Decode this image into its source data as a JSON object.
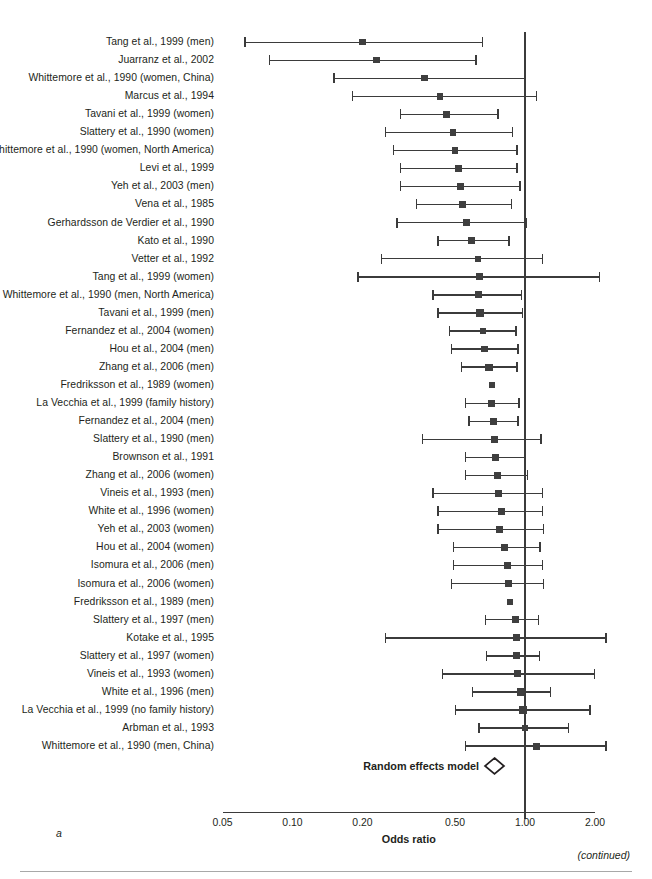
{
  "figure": {
    "panel_letter": "a",
    "continued_note": "(continued)",
    "axis_title": "Odds ratio",
    "summary_label": "Random effects model",
    "summary_marker": "diamond"
  },
  "chart_data": {
    "type": "forest",
    "title": "",
    "xlabel": "Odds ratio",
    "ylabel": "",
    "xscale": "log",
    "xlim": [
      0.05,
      2.0
    ],
    "xticks": [
      0.05,
      0.1,
      0.2,
      0.5,
      1.0,
      2.0
    ],
    "xticklabels": [
      "0.05",
      "0.10",
      "0.20",
      "0.50",
      "1.00",
      "2.00"
    ],
    "reference_line": 1.0,
    "grid": false,
    "legend": "none",
    "effect_measure": "Odds ratio",
    "studies": [
      {
        "label": "Tang et al., 1999 (men)",
        "or": 0.2,
        "lcl": 0.062,
        "ucl": 0.66,
        "weight": 2.4
      },
      {
        "label": "Juarranz et al., 2002",
        "or": 0.23,
        "lcl": 0.079,
        "ucl": 0.62,
        "weight": 2.6
      },
      {
        "label": "Whittemore et al., 1990 (women, China)",
        "or": 0.37,
        "lcl": 0.15,
        "ucl": 1.0,
        "weight": 2.5
      },
      {
        "label": "Marcus et al., 1994",
        "or": 0.43,
        "lcl": 0.18,
        "ucl": 1.13,
        "weight": 2.7
      },
      {
        "label": "Tavani et al., 1999 (women)",
        "or": 0.46,
        "lcl": 0.29,
        "ucl": 0.77,
        "weight": 2.6
      },
      {
        "label": "Slattery et al., 1990 (women)",
        "or": 0.49,
        "lcl": 0.25,
        "ucl": 0.89,
        "weight": 2.9
      },
      {
        "label": "Whittemore et al., 1990 (women, North America)",
        "or": 0.5,
        "lcl": 0.27,
        "ucl": 0.93,
        "weight": 3.0
      },
      {
        "label": "Levi et al., 1999",
        "or": 0.52,
        "lcl": 0.29,
        "ucl": 0.93,
        "weight": 3.2
      },
      {
        "label": "Yeh et al., 2003 (men)",
        "or": 0.53,
        "lcl": 0.29,
        "ucl": 0.96,
        "weight": 3.3
      },
      {
        "label": "Vena et al., 1985",
        "or": 0.54,
        "lcl": 0.34,
        "ucl": 0.88,
        "weight": 3.4
      },
      {
        "label": "Gerhardsson de Verdier et al., 1990",
        "or": 0.56,
        "lcl": 0.28,
        "ucl": 1.02,
        "weight": 3.6
      },
      {
        "label": "Kato et al., 1990",
        "or": 0.59,
        "lcl": 0.42,
        "ucl": 0.86,
        "weight": 3.1
      },
      {
        "label": "Vetter et al., 1992",
        "or": 0.63,
        "lcl": 0.24,
        "ucl": 1.2,
        "weight": 2.3
      },
      {
        "label": "Tang et al., 1999 (women)",
        "or": 0.64,
        "lcl": 0.19,
        "ucl": 2.1,
        "weight": 3.2
      },
      {
        "label": "Whittemore et al., 1990 (men, North America)",
        "or": 0.63,
        "lcl": 0.4,
        "ucl": 0.97,
        "weight": 3.3
      },
      {
        "label": "Tavani et al., 1999 (men)",
        "or": 0.64,
        "lcl": 0.42,
        "ucl": 0.98,
        "weight": 3.4
      },
      {
        "label": "Fernandez et al., 2004 (women)",
        "or": 0.66,
        "lcl": 0.47,
        "ucl": 0.92,
        "weight": 3.1
      },
      {
        "label": "Hou et al., 2004 (men)",
        "or": 0.67,
        "lcl": 0.48,
        "ucl": 0.94,
        "weight": 3.1
      },
      {
        "label": "Zhang et al., 2006 (men)",
        "or": 0.7,
        "lcl": 0.53,
        "ucl": 0.93,
        "weight": 3.3
      },
      {
        "label": "Fredriksson et al., 1989 (women)",
        "or": 0.72,
        "lcl": 0.72,
        "ucl": 0.72,
        "weight": 2.8
      },
      {
        "label": "La Vecchia et al., 1999 (family history)",
        "or": 0.72,
        "lcl": 0.55,
        "ucl": 0.95,
        "weight": 3.2
      },
      {
        "label": "Fernandez et al., 2004 (men)",
        "or": 0.73,
        "lcl": 0.57,
        "ucl": 0.94,
        "weight": 3.0
      },
      {
        "label": "Slattery et al., 1990 (men)",
        "or": 0.74,
        "lcl": 0.36,
        "ucl": 1.18,
        "weight": 3.2
      },
      {
        "label": "Brownson et al., 1991",
        "or": 0.75,
        "lcl": 0.55,
        "ucl": 1.01,
        "weight": 3.2
      },
      {
        "label": "Zhang et al., 2006 (women)",
        "or": 0.76,
        "lcl": 0.55,
        "ucl": 1.03,
        "weight": 3.0
      },
      {
        "label": "Vineis et al., 1993 (men)",
        "or": 0.77,
        "lcl": 0.4,
        "ucl": 1.2,
        "weight": 3.4
      },
      {
        "label": "White et al., 1996 (women)",
        "or": 0.79,
        "lcl": 0.42,
        "ucl": 1.2,
        "weight": 3.4
      },
      {
        "label": "Yeh et al., 2003 (women)",
        "or": 0.78,
        "lcl": 0.42,
        "ucl": 1.21,
        "weight": 3.2
      },
      {
        "label": "Hou et al., 2004 (women)",
        "or": 0.82,
        "lcl": 0.49,
        "ucl": 1.17,
        "weight": 3.2
      },
      {
        "label": "Isomura et al., 2006 (men)",
        "or": 0.84,
        "lcl": 0.49,
        "ucl": 1.2,
        "weight": 3.3
      },
      {
        "label": "Isomura et al., 2006 (women)",
        "or": 0.85,
        "lcl": 0.48,
        "ucl": 1.21,
        "weight": 3.3
      },
      {
        "label": "Fredriksson et al., 1989 (men)",
        "or": 0.86,
        "lcl": 0.86,
        "ucl": 0.86,
        "weight": 2.7
      },
      {
        "label": "Slattery et al., 1997 (men)",
        "or": 0.91,
        "lcl": 0.67,
        "ucl": 1.15,
        "weight": 3.2
      },
      {
        "label": "Kotake et al., 1995",
        "or": 0.92,
        "lcl": 0.25,
        "ucl": 2.25,
        "weight": 3.3
      },
      {
        "label": "Slattery et al., 1997 (women)",
        "or": 0.92,
        "lcl": 0.68,
        "ucl": 1.16,
        "weight": 3.2
      },
      {
        "label": "Vineis et al., 1993 (women)",
        "or": 0.93,
        "lcl": 0.44,
        "ucl": 2.0,
        "weight": 3.2
      },
      {
        "label": "White et al., 1996 (men)",
        "or": 0.96,
        "lcl": 0.59,
        "ucl": 1.3,
        "weight": 3.3
      },
      {
        "label": "La Vecchia et al., 1999 (no family history)",
        "or": 0.98,
        "lcl": 0.5,
        "ucl": 1.92,
        "weight": 3.4
      },
      {
        "label": "Arbman et al., 1993",
        "or": 1.0,
        "lcl": 0.63,
        "ucl": 1.55,
        "weight": 3.0
      },
      {
        "label": "Whittemore et al., 1990 (men, China)",
        "or": 1.12,
        "lcl": 0.55,
        "ucl": 2.25,
        "weight": 3.2
      }
    ],
    "summary": {
      "label": "Random effects model",
      "or": 0.74,
      "lcl": 0.7,
      "ucl": 0.79
    }
  }
}
